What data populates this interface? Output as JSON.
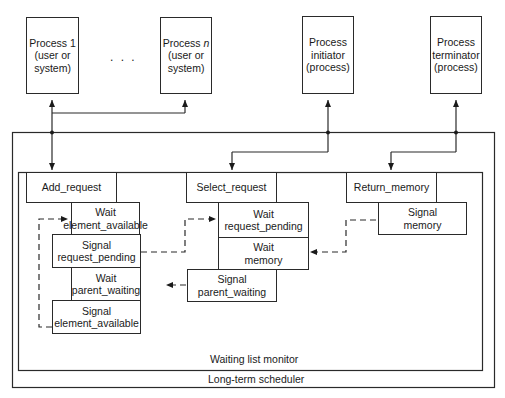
{
  "processes": [
    {
      "line1": "Process 1",
      "line2": "(user or",
      "line3": "system)"
    },
    {
      "line1": "Process",
      "line1_italic": "n",
      "line2": "(user or",
      "line3": "system)"
    },
    {
      "line1": "Process",
      "line2": "initiator",
      "line3": "(process)"
    },
    {
      "line1": "Process",
      "line2": "terminator",
      "line3": "(process)"
    }
  ],
  "ellipsis": ". . .",
  "scheduler": {
    "label": "Long-term scheduler"
  },
  "monitor": {
    "label": "Waiting list monitor",
    "procedures": [
      {
        "name": "Add_request"
      },
      {
        "name": "Select_request"
      },
      {
        "name": "Return_memory"
      }
    ],
    "operations": {
      "wait_element_available": {
        "line1": "Wait",
        "line2": "element_available"
      },
      "signal_request_pending": {
        "line1": "Signal",
        "line2": "request_pending"
      },
      "wait_parent_waiting": {
        "line1": "Wait",
        "line2": "parent_waiting"
      },
      "signal_element_available": {
        "line1": "Signal",
        "line2": "element_available"
      },
      "wait_request_pending": {
        "line1": "Wait",
        "line2": "request_pending"
      },
      "wait_memory": {
        "line1": "Wait",
        "line2": "memory"
      },
      "signal_parent_waiting": {
        "line1": "Signal",
        "line2": "parent_waiting"
      },
      "signal_memory": {
        "line1": "Signal",
        "line2": "memory"
      }
    }
  }
}
